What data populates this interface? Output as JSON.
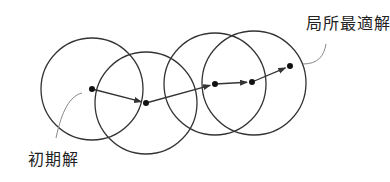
{
  "diagram": {
    "type": "local-search-neighborhood",
    "labels": {
      "local_optimum": "局所最適解",
      "initial_solution": "初期解"
    },
    "colors": {
      "stroke": "#333333",
      "leader": "#888888",
      "text": "#222222",
      "background": "#ffffff"
    },
    "neighborhoods": [
      {
        "cx": 92,
        "cy": 89,
        "r": 51
      },
      {
        "cx": 146,
        "cy": 103,
        "r": 51
      },
      {
        "cx": 215,
        "cy": 84,
        "r": 51
      },
      {
        "cx": 254,
        "cy": 83,
        "r": 52
      }
    ],
    "points": [
      {
        "x": 92,
        "y": 89,
        "role": "initial"
      },
      {
        "x": 146,
        "y": 103
      },
      {
        "x": 215,
        "y": 84
      },
      {
        "x": 252,
        "y": 82
      },
      {
        "x": 290,
        "y": 66,
        "role": "local-optimum"
      }
    ]
  }
}
